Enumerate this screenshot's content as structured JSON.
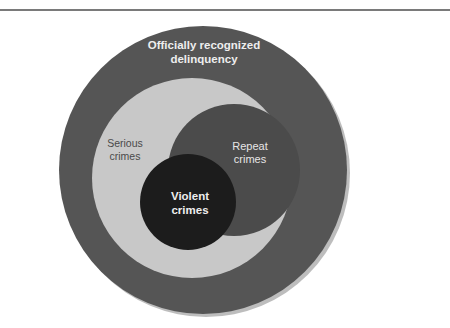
{
  "diagram": {
    "type": "nested-venn",
    "sets": [
      {
        "id": "officially-recognized-delinquency",
        "label_lines": [
          "Officially recognized",
          "delinquency"
        ],
        "color": "#555555",
        "contains": [
          "serious-crimes"
        ]
      },
      {
        "id": "serious-crimes",
        "label_lines": [
          "Serious",
          "crimes"
        ],
        "color": "#c8c8c8",
        "contains": [
          "repeat-crimes",
          "violent-crimes"
        ]
      },
      {
        "id": "repeat-crimes",
        "label_lines": [
          "Repeat",
          "crimes"
        ],
        "color": "#4b4b4b",
        "overlaps": [
          "violent-crimes"
        ]
      },
      {
        "id": "violent-crimes",
        "label_lines": [
          "Violent",
          "crimes"
        ],
        "color": "#1c1c1c",
        "overlaps": [
          "repeat-crimes"
        ]
      }
    ],
    "shadow_color": "#bdbdbd",
    "rule_color": "#7a7a7a"
  },
  "labels": {
    "outer": "Officially recognized\ndelinquency",
    "outer_line1": "Officially recognized",
    "outer_line2": "delinquency",
    "serious_line1": "Serious",
    "serious_line2": "crimes",
    "repeat_line1": "Repeat",
    "repeat_line2": "crimes",
    "violent_line1": "Violent",
    "violent_line2": "crimes"
  }
}
